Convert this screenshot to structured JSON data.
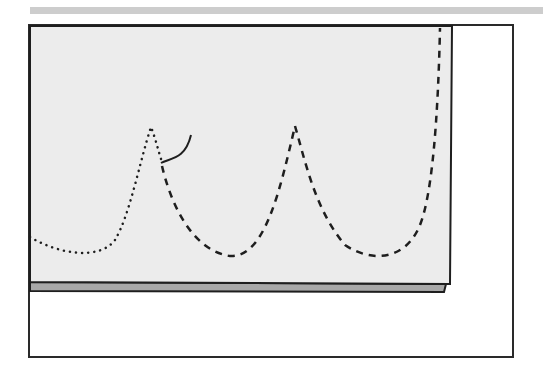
{
  "illustration": {
    "subject": "fabric sheet with stitch pattern",
    "colors": {
      "background": "#ffffff",
      "sheet_fill": "#ececec",
      "sheet_edge_shadow": "#a8a8a8",
      "top_bar": "#cdcdcd",
      "ink": "#1e1e1e"
    },
    "lines": [
      {
        "style": "dotted",
        "description": "completed stitch arc (left)"
      },
      {
        "style": "dashed",
        "description": "planned stitch arcs (right)"
      },
      {
        "style": "solid",
        "description": "thread tail at peak"
      }
    ]
  }
}
